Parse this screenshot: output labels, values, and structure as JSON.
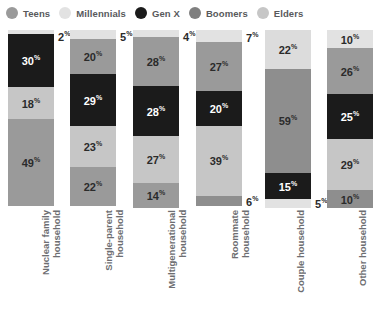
{
  "legend": {
    "items": [
      {
        "label": "Teens",
        "key": "teens",
        "color": "#9a9a9a"
      },
      {
        "label": "Millennials",
        "key": "millennials",
        "color": "#e2e2e2"
      },
      {
        "label": "Gen X",
        "key": "genx",
        "color": "#1b1b1b"
      },
      {
        "label": "Boomers",
        "key": "boomers",
        "color": "#7f7f7f"
      },
      {
        "label": "Elders",
        "key": "elders",
        "color": "#c6c6c6"
      }
    ]
  },
  "chart_data": {
    "type": "bar",
    "subtype": "stacked-column-100",
    "title": "",
    "xlabel": "",
    "ylabel": "",
    "ylim": [
      0,
      100
    ],
    "grid": false,
    "legend_position": "top-left",
    "value_suffix": "%",
    "categories": [
      "Nuclear family household",
      "Single-parent household",
      "Multigenerational household",
      "Roommate household",
      "Couple household",
      "Other household"
    ],
    "stack_order_top_to_bottom": [
      "millennials",
      "teens",
      "genx",
      "elders",
      "boomers"
    ],
    "series": [
      {
        "name": "Millennials",
        "key": "millennials",
        "color": "#e2e2e2",
        "values": [
          2,
          5,
          4,
          7,
          5,
          10
        ]
      },
      {
        "name": "Teens",
        "key": "teens",
        "color": "#9a9a9a",
        "values": [
          null,
          20,
          28,
          27,
          null,
          26
        ]
      },
      {
        "name": "Gen X",
        "key": "genx",
        "color": "#1b1b1b",
        "values": [
          30,
          29,
          28,
          20,
          15,
          25
        ]
      },
      {
        "name": "Elders",
        "key": "elders",
        "color": "#c6c6c6",
        "values": [
          18,
          23,
          27,
          39,
          22,
          29
        ]
      },
      {
        "name": "Boomers",
        "key": "boomers",
        "color": "#7f7f7f",
        "values": [
          49,
          22,
          14,
          6,
          59,
          10
        ]
      }
    ],
    "bars": [
      {
        "category": "Nuclear family household",
        "label_lines": "Nuclear family\nhousehold",
        "segments": [
          {
            "key": "millennials",
            "label": "2",
            "color": "#e2e2e2",
            "text": "#2b2b2b",
            "outside": true
          },
          {
            "key": "genx",
            "label": "30",
            "color": "#1b1b1b",
            "text": "#ffffff",
            "outside": false
          },
          {
            "key": "elders",
            "label": "18",
            "color": "#c6c6c6",
            "text": "#2b2b2b",
            "outside": false
          },
          {
            "key": "boomers",
            "label": "49",
            "color": "#9a9a9a",
            "text": "#2b2b2b",
            "outside": false
          }
        ]
      },
      {
        "category": "Single-parent household",
        "label_lines": "Single-parent\nhousehold",
        "segments": [
          {
            "key": "millennials",
            "label": "5",
            "color": "#e2e2e2",
            "text": "#2b2b2b",
            "outside": true
          },
          {
            "key": "teens",
            "label": "20",
            "color": "#9a9a9a",
            "text": "#2b2b2b",
            "outside": false
          },
          {
            "key": "genx",
            "label": "29",
            "color": "#1b1b1b",
            "text": "#ffffff",
            "outside": false
          },
          {
            "key": "elders",
            "label": "23",
            "color": "#c6c6c6",
            "text": "#2b2b2b",
            "outside": false
          },
          {
            "key": "boomers",
            "label": "22",
            "color": "#9a9a9a",
            "text": "#2b2b2b",
            "outside": false
          }
        ]
      },
      {
        "category": "Multigenerational household",
        "label_lines": "Multigenerational\nhousehold",
        "segments": [
          {
            "key": "millennials",
            "label": "4",
            "color": "#e2e2e2",
            "text": "#2b2b2b",
            "outside": true
          },
          {
            "key": "teens",
            "label": "28",
            "color": "#9a9a9a",
            "text": "#2b2b2b",
            "outside": false
          },
          {
            "key": "genx",
            "label": "28",
            "color": "#1b1b1b",
            "text": "#ffffff",
            "outside": false
          },
          {
            "key": "elders",
            "label": "27",
            "color": "#c6c6c6",
            "text": "#2b2b2b",
            "outside": false
          },
          {
            "key": "boomers",
            "label": "14",
            "color": "#9a9a9a",
            "text": "#2b2b2b",
            "outside": false
          }
        ]
      },
      {
        "category": "Roommate household",
        "label_lines": "Roommate\nhousehold",
        "segments": [
          {
            "key": "millennials",
            "label": "7",
            "color": "#e2e2e2",
            "text": "#2b2b2b",
            "outside": true
          },
          {
            "key": "teens",
            "label": "27",
            "color": "#9a9a9a",
            "text": "#2b2b2b",
            "outside": false
          },
          {
            "key": "genx",
            "label": "20",
            "color": "#1b1b1b",
            "text": "#ffffff",
            "outside": false
          },
          {
            "key": "elders",
            "label": "39",
            "color": "#c6c6c6",
            "text": "#2b2b2b",
            "outside": false
          },
          {
            "key": "boomers",
            "label": "6",
            "color": "#8e8e8e",
            "text": "#2b2b2b",
            "outside": true
          }
        ]
      },
      {
        "category": "Couple household",
        "label_lines": "Couple household",
        "segments": [
          {
            "key": "elders",
            "label": "22",
            "color": "#dcdcdc",
            "text": "#2b2b2b",
            "outside": false
          },
          {
            "key": "boomers",
            "label": "59",
            "color": "#8e8e8e",
            "text": "#2b2b2b",
            "outside": false
          },
          {
            "key": "genx",
            "label": "15",
            "color": "#1b1b1b",
            "text": "#ffffff",
            "outside": false
          },
          {
            "key": "millennials",
            "label": "5",
            "color": "#e2e2e2",
            "text": "#2b2b2b",
            "outside": true
          }
        ]
      },
      {
        "category": "Other household",
        "label_lines": "Other household",
        "segments": [
          {
            "key": "millennials",
            "label": "10",
            "color": "#e2e2e2",
            "text": "#2b2b2b",
            "outside": false
          },
          {
            "key": "teens",
            "label": "26",
            "color": "#9a9a9a",
            "text": "#2b2b2b",
            "outside": false
          },
          {
            "key": "genx",
            "label": "25",
            "color": "#1b1b1b",
            "text": "#ffffff",
            "outside": false
          },
          {
            "key": "elders",
            "label": "29",
            "color": "#c6c6c6",
            "text": "#2b2b2b",
            "outside": false
          },
          {
            "key": "boomers",
            "label": "10",
            "color": "#8e8e8e",
            "text": "#2b2b2b",
            "outside": false
          }
        ]
      }
    ]
  },
  "layout": {
    "bar_x": [
      8,
      70,
      133,
      196,
      265,
      327
    ],
    "bar_w": [
      46,
      46,
      46,
      46,
      46,
      46
    ],
    "label_x": [
      40,
      103,
      166,
      229,
      295,
      357
    ]
  }
}
